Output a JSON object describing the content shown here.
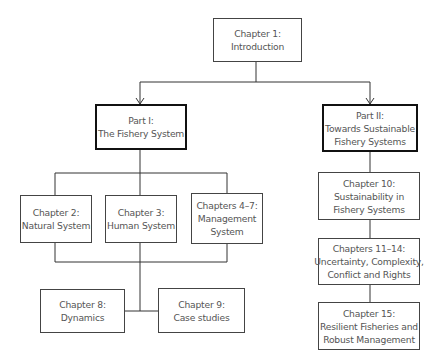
{
  "diagram": {
    "type": "flowchart",
    "nodes": [
      {
        "id": "ch1",
        "lines": [
          "Chapter 1:",
          "Introduction"
        ]
      },
      {
        "id": "part1",
        "lines": [
          "Part I:",
          "The Fishery System"
        ]
      },
      {
        "id": "part2",
        "lines": [
          "Part II:",
          "Towards Sustainable",
          "Fishery Systems"
        ]
      },
      {
        "id": "ch2",
        "lines": [
          "Chapter 2:",
          "Natural System"
        ]
      },
      {
        "id": "ch3",
        "lines": [
          "Chapter 3:",
          "Human System"
        ]
      },
      {
        "id": "ch4_7",
        "lines": [
          "Chapters 4–7:",
          "Management",
          "System"
        ]
      },
      {
        "id": "ch8",
        "lines": [
          "Chapter 8:",
          "Dynamics"
        ]
      },
      {
        "id": "ch9",
        "lines": [
          "Chapter 9:",
          "Case studies"
        ]
      },
      {
        "id": "ch10",
        "lines": [
          "Chapter 10:",
          "Sustainability in",
          "Fishery Systems"
        ]
      },
      {
        "id": "ch11_14",
        "lines": [
          "Chapters 11–14:",
          "Uncertainty, Complexity,",
          "Conflict and Rights"
        ]
      },
      {
        "id": "ch15",
        "lines": [
          "Chapter 15:",
          "Resilient Fisheries and",
          "Robust Management"
        ]
      }
    ],
    "edges": [
      {
        "from": "ch1",
        "to": "part1",
        "arrow": true
      },
      {
        "from": "ch1",
        "to": "part2",
        "arrow": true
      },
      {
        "from": "part1",
        "to": "ch2"
      },
      {
        "from": "part1",
        "to": "ch3"
      },
      {
        "from": "part1",
        "to": "ch4_7"
      },
      {
        "from": "ch2",
        "to": "ch8"
      },
      {
        "from": "ch3",
        "to": "ch8"
      },
      {
        "from": "ch4_7",
        "to": "ch9"
      },
      {
        "from": "part2",
        "to": "ch10"
      },
      {
        "from": "ch10",
        "to": "ch11_14"
      },
      {
        "from": "ch11_14",
        "to": "ch15"
      }
    ]
  }
}
